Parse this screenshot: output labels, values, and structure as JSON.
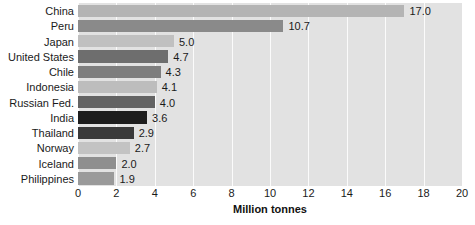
{
  "chart_data": {
    "type": "bar",
    "orientation": "horizontal",
    "title": "",
    "xlabel": "Million tonnes",
    "ylabel": "",
    "xlim": [
      0,
      20
    ],
    "xticks": [
      0,
      2,
      4,
      6,
      8,
      10,
      12,
      14,
      16,
      18,
      20
    ],
    "grid": true,
    "grid_axis": "x",
    "legend": false,
    "categories": [
      "China",
      "Peru",
      "Japan",
      "United States",
      "Chile",
      "Indonesia",
      "Russian Fed.",
      "India",
      "Thailand",
      "Norway",
      "Iceland",
      "Philippines"
    ],
    "values": [
      17.0,
      10.7,
      5.0,
      4.7,
      4.3,
      4.1,
      4.0,
      3.6,
      2.9,
      2.7,
      2.0,
      1.9
    ],
    "value_labels": [
      "17.0",
      "10.7",
      "5.0",
      "4.7",
      "4.3",
      "4.1",
      "4.0",
      "3.6",
      "2.9",
      "2.7",
      "2.0",
      "1.9"
    ],
    "bar_colors": [
      "#b4b4b4",
      "#8a8a8a",
      "#c0c0c0",
      "#6e6e6e",
      "#7e7e7e",
      "#bdbdbd",
      "#636363",
      "#1d1d1d",
      "#3a3a3a",
      "#c3c3c3",
      "#8f8f8f",
      "#9a9a9a"
    ],
    "plot_background": "#e2e2e2",
    "gridline_color": "#fbfbfb",
    "text_color": "#1a1a1a"
  }
}
